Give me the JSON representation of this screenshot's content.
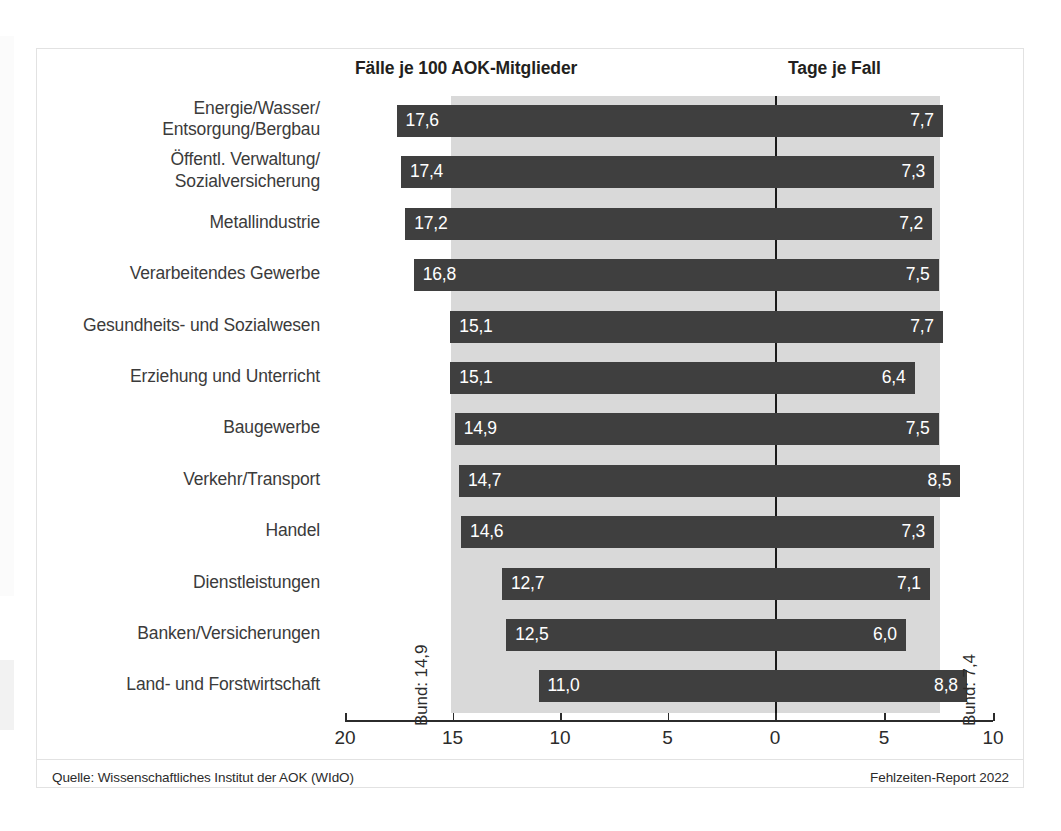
{
  "headers": {
    "left": "Fälle je 100 AOK-Mitglieder",
    "right": "Tage je Fall"
  },
  "annotations": {
    "bund_left": "Bund: 14,9",
    "bund_right": "Bund: 7,4"
  },
  "footer": {
    "source": "Quelle: Wissenschaftliches Institut der AOK (WIdO)",
    "report": "Fehlzeiten-Report 2022"
  },
  "axis": {
    "ticks": [
      "20",
      "15",
      "10",
      "5",
      "0",
      "5",
      "10"
    ]
  },
  "colors": {
    "bar": "#3f3f3f",
    "band": "#d9d9d9",
    "zero_line": "#1a1a1a",
    "frame": "#e2e2e2",
    "text": "#231f20",
    "bar_value_text": "#ffffff"
  },
  "chart_data": {
    "type": "bar",
    "title": "",
    "subtitle": "",
    "orientation": "horizontal",
    "layout": "back-to-back / diverging two-panel",
    "grid": false,
    "legend": null,
    "categories": [
      "Energie/Wasser/ Entsorgung/Bergbau",
      "Öffentl. Verwaltung/ Sozialversicherung",
      "Metallindustrie",
      "Verarbeitendes Gewerbe",
      "Gesundheits- und Sozialwesen",
      "Erziehung und Unterricht",
      "Baugewerbe",
      "Verkehr/Transport",
      "Handel",
      "Dienstleistungen",
      "Banken/Versicherungen",
      "Land- und Forstwirtschaft"
    ],
    "series": [
      {
        "name": "Fälle je 100 AOK-Mitglieder",
        "panel": "left",
        "axis_direction": "right-to-left",
        "xlim": [
          20,
          0
        ],
        "xticks": [
          20,
          15,
          10,
          5,
          0
        ],
        "reference_value": 14.9,
        "reference_label": "Bund: 14,9",
        "values": [
          17.6,
          17.4,
          17.2,
          16.8,
          15.1,
          15.1,
          14.9,
          14.7,
          14.6,
          12.7,
          12.5,
          11.0
        ],
        "value_labels": [
          "17,6",
          "17,4",
          "17,2",
          "16,8",
          "15,1",
          "15,1",
          "14,9",
          "14,7",
          "14,6",
          "12,7",
          "12,5",
          "11,0"
        ]
      },
      {
        "name": "Tage je Fall",
        "panel": "right",
        "axis_direction": "left-to-right",
        "xlim": [
          0,
          10
        ],
        "xticks": [
          0,
          5,
          10
        ],
        "reference_value": 7.4,
        "reference_label": "Bund: 7,4",
        "values": [
          7.7,
          7.3,
          7.2,
          7.5,
          7.7,
          6.4,
          7.5,
          8.5,
          7.3,
          7.1,
          6.0,
          8.8
        ],
        "value_labels": [
          "7,7",
          "7,3",
          "7,2",
          "7,5",
          "7,7",
          "6,4",
          "7,5",
          "8,5",
          "7,3",
          "7,1",
          "6,0",
          "8,8"
        ]
      }
    ],
    "xlabel": "",
    "ylabel": "",
    "source": "Quelle: Wissenschaftliches Institut der AOK (WIdO)",
    "credit": "Fehlzeiten-Report 2022"
  }
}
